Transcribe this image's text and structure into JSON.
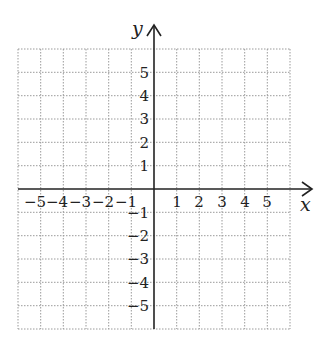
{
  "diagram": {
    "type": "coordinate-grid",
    "x_axis": {
      "label": "x",
      "ticks": [
        "-5",
        "-4",
        "-3",
        "-2",
        "-1",
        "1",
        "2",
        "3",
        "4",
        "5"
      ]
    },
    "y_axis": {
      "label": "y",
      "ticks": [
        "5",
        "4",
        "3",
        "2",
        "1",
        "-1",
        "-2",
        "-3",
        "-4",
        "-5"
      ]
    },
    "grid": {
      "columns": 12,
      "rows": 12,
      "style": "dotted"
    },
    "colors": {
      "axis": "#222222",
      "grid": "#9a9a9a",
      "text": "#222222"
    }
  }
}
